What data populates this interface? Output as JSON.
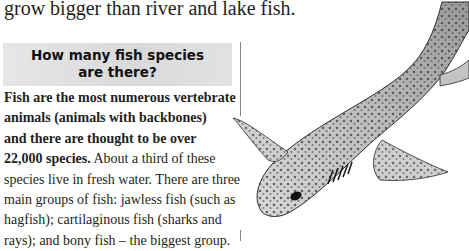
{
  "intro": {
    "text": "grow bigger than river and lake fish."
  },
  "sidebar_box": {
    "title_line1": "How many fish species",
    "title_line2": "are there?"
  },
  "body": {
    "lines": [
      {
        "bold": "Fish are the most numerous vertebrate",
        "normal": ""
      },
      {
        "bold": "animals (animals with backbones)",
        "normal": ""
      },
      {
        "bold": "and there are thought to be over",
        "normal": ""
      },
      {
        "bold": "22,000 species.",
        "normal": " About a third of these"
      },
      {
        "bold": "",
        "normal": "species live in fresh water. There are three"
      },
      {
        "bold": "",
        "normal": "main groups of fish: jawless fish (such as"
      },
      {
        "bold": "",
        "normal": "hagfish); cartilaginous fish (sharks and"
      },
      {
        "bold": "",
        "normal": "rays); and bony fish – the biggest group."
      }
    ]
  },
  "illustration": {
    "subject": "spotted-shark",
    "colors": {
      "body": "#c9c9c9",
      "spots": "#4a4a4a",
      "outline": "#2b2b2b"
    }
  }
}
